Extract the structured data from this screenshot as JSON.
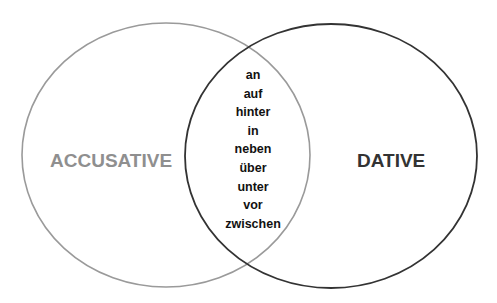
{
  "diagram": {
    "type": "venn",
    "sets": [
      {
        "id": "accusative",
        "label": "ACCUSATIVE",
        "stroke_color": "#9a9a9a",
        "label_color": "#8f8f8f",
        "ellipse": {
          "cx": 166,
          "cy": 155,
          "rx": 144,
          "ry": 132
        }
      },
      {
        "id": "dative",
        "label": "DATIVE",
        "stroke_color": "#333333",
        "label_color": "#333333",
        "ellipse": {
          "cx": 331,
          "cy": 156,
          "rx": 146,
          "ry": 132
        }
      }
    ],
    "intersection": {
      "items": [
        "an",
        "auf",
        "hinter",
        "in",
        "neben",
        "über",
        "unter",
        "vor",
        "zwischen"
      ]
    }
  }
}
